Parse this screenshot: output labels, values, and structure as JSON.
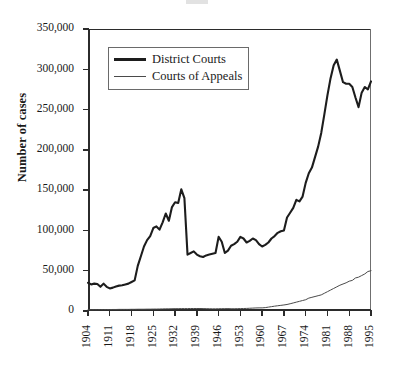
{
  "chart_data": {
    "type": "line",
    "title": "",
    "xlabel": "",
    "ylabel": "Number of cases",
    "xlim": [
      1904,
      1995
    ],
    "ylim": [
      0,
      350000
    ],
    "grid": false,
    "legend_position": "upper-left-inside",
    "ytick_labels": [
      "0",
      "50,000",
      "100,000",
      "150,000",
      "200,000",
      "250,000",
      "300,000",
      "350,000"
    ],
    "ytick_values": [
      0,
      50000,
      100000,
      150000,
      200000,
      250000,
      300000,
      350000
    ],
    "xtick_labels": [
      "1904",
      "1911",
      "1918",
      "1925",
      "1932",
      "1939",
      "1946",
      "1953",
      "1960",
      "1967",
      "1974",
      "1981",
      "1988",
      "1995"
    ],
    "xtick_values": [
      1904,
      1911,
      1918,
      1925,
      1932,
      1939,
      1946,
      1953,
      1960,
      1967,
      1974,
      1981,
      1988,
      1995
    ],
    "x": [
      1904,
      1905,
      1906,
      1907,
      1908,
      1909,
      1910,
      1911,
      1912,
      1913,
      1914,
      1915,
      1916,
      1917,
      1918,
      1919,
      1920,
      1921,
      1922,
      1923,
      1924,
      1925,
      1926,
      1927,
      1928,
      1929,
      1930,
      1931,
      1932,
      1933,
      1934,
      1935,
      1936,
      1937,
      1938,
      1939,
      1940,
      1941,
      1942,
      1943,
      1944,
      1945,
      1946,
      1947,
      1948,
      1949,
      1950,
      1951,
      1952,
      1953,
      1954,
      1955,
      1956,
      1957,
      1958,
      1959,
      1960,
      1961,
      1962,
      1963,
      1964,
      1965,
      1966,
      1967,
      1968,
      1969,
      1970,
      1971,
      1972,
      1973,
      1974,
      1975,
      1976,
      1977,
      1978,
      1979,
      1980,
      1981,
      1982,
      1983,
      1984,
      1985,
      1986,
      1987,
      1988,
      1989,
      1990,
      1991,
      1992,
      1993,
      1994,
      1995
    ],
    "series": [
      {
        "name": "District Courts",
        "style": "thick",
        "color": "#1d1d1d",
        "values": [
          35000,
          33000,
          34000,
          33500,
          30000,
          34000,
          30000,
          28000,
          29000,
          30500,
          31500,
          32000,
          33000,
          34000,
          36000,
          38000,
          56000,
          68000,
          80000,
          88000,
          93000,
          103000,
          105000,
          101000,
          110000,
          121000,
          112000,
          129000,
          135000,
          134000,
          151000,
          140000,
          70000,
          72000,
          74000,
          70000,
          68000,
          67000,
          69000,
          70000,
          71000,
          72000,
          92000,
          86000,
          72000,
          75000,
          81000,
          83000,
          86000,
          92000,
          90000,
          85000,
          87000,
          90000,
          88000,
          83000,
          80000,
          82000,
          85000,
          90000,
          93000,
          97000,
          99000,
          100000,
          116000,
          122000,
          128000,
          138000,
          136000,
          142000,
          159000,
          171000,
          178000,
          191000,
          204000,
          221000,
          244000,
          268000,
          289000,
          305000,
          312000,
          298000,
          284000,
          282000,
          282000,
          278000,
          265000,
          253000,
          271000,
          278000,
          275000,
          285000
        ]
      },
      {
        "name": "Courts of Appeals",
        "style": "thin",
        "color": "#4a4a4a",
        "values": [
          1500,
          1500,
          1600,
          1600,
          1700,
          1700,
          1800,
          1800,
          1900,
          1900,
          2000,
          2000,
          2000,
          2000,
          2100,
          2100,
          2200,
          2200,
          2200,
          2300,
          2300,
          2400,
          2400,
          2500,
          2600,
          2700,
          2700,
          2800,
          2900,
          2900,
          3000,
          3000,
          3000,
          3100,
          3100,
          3100,
          3100,
          3000,
          2900,
          2800,
          2700,
          2700,
          2800,
          2900,
          2900,
          3000,
          2800,
          2800,
          2900,
          3000,
          3100,
          3200,
          3400,
          3600,
          3800,
          3900,
          3900,
          4200,
          4800,
          5400,
          6000,
          6500,
          7000,
          7500,
          8100,
          9000,
          10000,
          11000,
          12000,
          13000,
          14000,
          16000,
          17000,
          18000,
          19000,
          20000,
          22000,
          24000,
          26000,
          28000,
          30000,
          32000,
          33500,
          35000,
          37000,
          38000,
          41000,
          42000,
          44000,
          46000,
          49000,
          50000
        ]
      }
    ]
  },
  "legend": {
    "items": [
      {
        "label": "District Courts"
      },
      {
        "label": "Courts of Appeals"
      }
    ]
  }
}
